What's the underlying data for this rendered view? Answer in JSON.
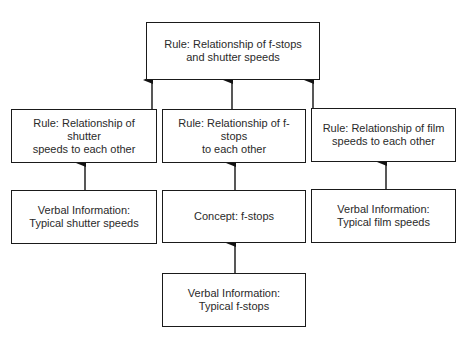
{
  "diagram": {
    "type": "learning-hierarchy",
    "nodes": [
      {
        "id": "top_rule",
        "lines": [
          "Rule: Relationship of f-stops",
          "and shutter speeds"
        ]
      },
      {
        "id": "rule_shutter",
        "lines": [
          "Rule: Relationship of shutter",
          "speeds to each other"
        ]
      },
      {
        "id": "rule_fstops",
        "lines": [
          "Rule: Relationship of f-stops",
          "to each other"
        ]
      },
      {
        "id": "rule_film",
        "lines": [
          "Rule: Relationship of film",
          "speeds to each other"
        ]
      },
      {
        "id": "verbal_shutter",
        "lines": [
          "Verbal Information:",
          "Typical shutter speeds"
        ]
      },
      {
        "id": "concept_fstops",
        "lines": [
          "Concept: f-stops"
        ]
      },
      {
        "id": "verbal_film",
        "lines": [
          "Verbal Information:",
          "Typical film speeds"
        ]
      },
      {
        "id": "verbal_fstops",
        "lines": [
          "Verbal Information:",
          "Typical f-stops"
        ]
      }
    ],
    "edges": [
      {
        "from": "rule_shutter",
        "to": "top_rule"
      },
      {
        "from": "rule_fstops",
        "to": "top_rule"
      },
      {
        "from": "rule_film",
        "to": "top_rule"
      },
      {
        "from": "verbal_shutter",
        "to": "rule_shutter"
      },
      {
        "from": "concept_fstops",
        "to": "rule_fstops"
      },
      {
        "from": "verbal_film",
        "to": "rule_film"
      },
      {
        "from": "verbal_fstops",
        "to": "concept_fstops"
      }
    ]
  }
}
